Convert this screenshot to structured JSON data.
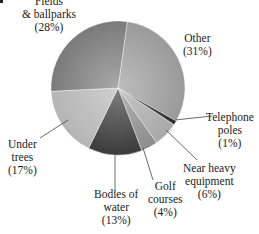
{
  "chart_data": {
    "type": "pie",
    "title": "",
    "slices": [
      {
        "label": "Other",
        "value": 31,
        "color": "#9a9a9a"
      },
      {
        "label": "Telephone poles",
        "value": 1,
        "color": "#2a2a2a"
      },
      {
        "label": "Near heavy equipment",
        "value": 6,
        "color": "#a8a8a8"
      },
      {
        "label": "Golf courses",
        "value": 4,
        "color": "#8c8c8c"
      },
      {
        "label": "Bodies of water",
        "value": 13,
        "color": "#3a3a3a"
      },
      {
        "label": "Under trees",
        "value": 17,
        "color": "#b5b5b5"
      },
      {
        "label": "Fields & ballparks",
        "value": 28,
        "color": "#7a7a7a"
      }
    ],
    "categories": [
      "Other",
      "Telephone poles",
      "Near heavy equipment",
      "Golf courses",
      "Bodies of water",
      "Under trees",
      "Fields & ballparks"
    ],
    "values": [
      31,
      1,
      6,
      4,
      13,
      17,
      28
    ],
    "legend": "none (direct labels)"
  },
  "labels": {
    "fields": {
      "line1": "Fields",
      "line2": "& ballparks",
      "pct": "(28%)"
    },
    "other": {
      "line1": "Other",
      "pct": "(31%)"
    },
    "telephone": {
      "line1": "Telephone",
      "line2": "poles",
      "pct": "(1%)"
    },
    "heavy": {
      "line1": "Near heavy",
      "line2": "equipment",
      "pct": "(6%)"
    },
    "golf": {
      "line1": "Golf",
      "line2": "courses",
      "pct": "(4%)"
    },
    "water": {
      "line1": "Bodies of",
      "line2": "water",
      "pct": "(13%)"
    },
    "trees": {
      "line1": "Under",
      "line2": "trees",
      "pct": "(17%)"
    }
  }
}
